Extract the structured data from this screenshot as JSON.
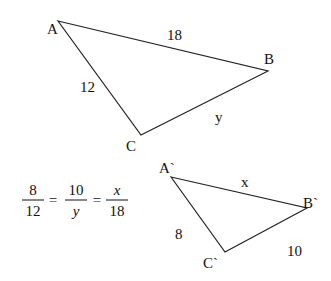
{
  "diagram": {
    "type": "similar-triangles",
    "line_color": "#222222",
    "text_color": "#111111",
    "triangle_1": {
      "vertices": {
        "A": {
          "label": "A",
          "x": 58,
          "y": 21,
          "lx": 47,
          "ly": 34
        },
        "B": {
          "label": "B",
          "x": 268,
          "y": 71,
          "lx": 264,
          "ly": 64
        },
        "C": {
          "label": "C",
          "x": 141,
          "y": 135,
          "lx": 126,
          "ly": 151
        }
      },
      "sides": {
        "AB": {
          "label": "18",
          "lx": 167,
          "ly": 40
        },
        "AC": {
          "label": "12",
          "lx": 80,
          "ly": 92
        },
        "BC": {
          "label": "y",
          "lx": 215,
          "ly": 122
        }
      }
    },
    "triangle_2": {
      "vertices": {
        "A": {
          "label": "A`",
          "x": 171,
          "y": 177,
          "lx": 159,
          "ly": 173
        },
        "B": {
          "label": "B`",
          "x": 307,
          "y": 208,
          "lx": 303,
          "ly": 208
        },
        "C": {
          "label": "C`",
          "x": 225,
          "y": 252,
          "lx": 203,
          "ly": 268
        }
      },
      "sides": {
        "AB": {
          "label": "x",
          "lx": 241,
          "ly": 187
        },
        "AC": {
          "label": "8",
          "lx": 175,
          "ly": 239
        },
        "BC": {
          "label": "10",
          "lx": 287,
          "ly": 256
        }
      }
    },
    "equation": {
      "fractions": [
        {
          "num": "8",
          "den": "12",
          "den_italic": false,
          "num_italic": false,
          "cx": 33
        },
        {
          "num": "10",
          "den": "y",
          "den_italic": true,
          "num_italic": false,
          "cx": 76
        },
        {
          "num": "x",
          "den": "18",
          "den_italic": false,
          "num_italic": true,
          "cx": 117
        }
      ],
      "equals": [
        {
          "symbol": "=",
          "cx": 53
        },
        {
          "symbol": "=",
          "cx": 97
        }
      ],
      "bar_y": 200,
      "text": "8/12 = 10/y = x/18"
    }
  }
}
